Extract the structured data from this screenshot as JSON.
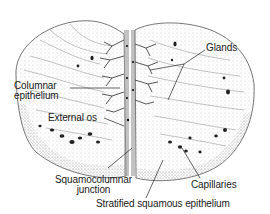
{
  "diagram": {
    "labels": {
      "columnar_epithelium": [
        "Columnar",
        "epithelium"
      ],
      "external_os": "External os",
      "glands": "Glands",
      "squamocolumnar_junction": [
        "Squamocolumnar",
        "junction"
      ],
      "capillaries": "Capillaries",
      "stratified_squamous_epithelium": "Stratified squamous epithelium"
    },
    "colors": {
      "ink": "#222222",
      "tissue_shade": "#b8b8b8",
      "background": "#ffffff"
    }
  }
}
